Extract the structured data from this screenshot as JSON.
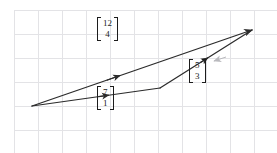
{
  "figure": {
    "background_color": "#ffffff",
    "grid": {
      "line_color": "#e3e3e6",
      "origin_x": 14,
      "origin_y": 10,
      "spacing": 24,
      "cols": 11,
      "rows": 6,
      "width": 254,
      "height": 133
    },
    "stroke_color": "#2b2b2b",
    "accent_color": "#b9b9bd"
  },
  "chart_data": {
    "type": "diagram",
    "xlabel": "",
    "ylabel": "",
    "grid": true,
    "legend": "none",
    "equation": "[7,1] + [5,3] = [12,4]",
    "points": {
      "start": [
        32,
        106
      ],
      "bend": [
        160,
        88
      ],
      "apex": [
        252,
        30
      ]
    },
    "vectors": [
      {
        "name": "u",
        "components": [
          7,
          1
        ],
        "label_top": "7",
        "label_bottom": "1",
        "from": [
          32,
          106
        ],
        "to": [
          160,
          88
        ],
        "label_pos": [
          108,
          99
        ]
      },
      {
        "name": "v",
        "components": [
          5,
          3
        ],
        "label_top": "5",
        "label_bottom": "3",
        "from": [
          160,
          88
        ],
        "to": [
          252,
          30
        ],
        "label_pos": [
          200,
          72
        ]
      },
      {
        "name": "u+v",
        "components": [
          12,
          4
        ],
        "label_top": "12",
        "label_bottom": "4",
        "from": [
          32,
          106
        ],
        "to": [
          252,
          30
        ],
        "label_pos": [
          108,
          30
        ]
      }
    ]
  }
}
